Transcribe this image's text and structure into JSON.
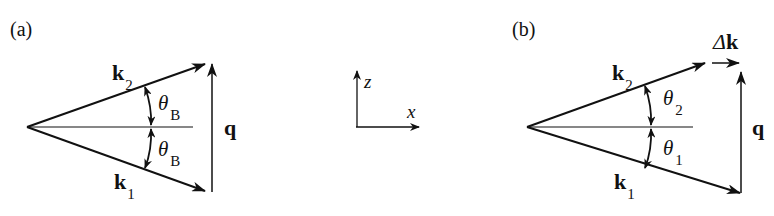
{
  "panels": [
    {
      "label": "(a)",
      "k2": {
        "main": "k",
        "sub": "2"
      },
      "k1": {
        "main": "k",
        "sub": "1"
      },
      "q": "q",
      "theta_upper": {
        "main": "θ",
        "sub": "B"
      },
      "theta_lower": {
        "main": "θ",
        "sub": "B"
      }
    },
    {
      "label": "(b)",
      "k2": {
        "main": "k",
        "sub": "2"
      },
      "k1": {
        "main": "k",
        "sub": "1"
      },
      "q": "q",
      "delta_k": {
        "delta": "Δ",
        "main": "k"
      },
      "theta_upper": {
        "main": "θ",
        "sub": "2"
      },
      "theta_lower": {
        "main": "θ",
        "sub": "1"
      }
    }
  ],
  "axes": {
    "z": "z",
    "x": "x"
  },
  "colors": {
    "stroke": "#111111",
    "background": "#ffffff"
  }
}
